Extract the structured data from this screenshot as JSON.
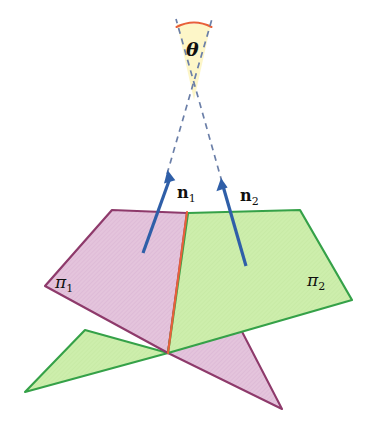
{
  "figure": {
    "background_color": "#ffffff",
    "width": 375,
    "height": 430
  },
  "labels": {
    "theta": "θ",
    "normal_1_symbol": "n",
    "normal_1_index": "1",
    "normal_2_symbol": "n",
    "normal_2_index": "2",
    "plane_1_symbol": "π",
    "plane_1_index": "1",
    "plane_2_symbol": "π",
    "plane_2_index": "2"
  },
  "colors": {
    "plane_1_fill": "#e4c4dc",
    "plane_1_stroke": "#8e3a6b",
    "plane_2_fill": "#cdeeac",
    "plane_2_stroke": "#35a148",
    "intersection_line": "#e8603a",
    "normal_arrow": "#2f5fa8",
    "dashed_line": "#6b7fa8",
    "angle_wedge_fill": "#fdf6c8",
    "angle_arc": "#e8603a",
    "text": "#10100f"
  },
  "geometry": {
    "plane_1": {
      "name": "pi-1",
      "description": "magenta plane, quadrilateral plus lower-right tail triangle",
      "main_polygon": [
        [
          112,
          210
        ],
        [
          45,
          286
        ],
        [
          168,
          353
        ],
        [
          187,
          213
        ]
      ],
      "tail_polygon": [
        [
          168,
          353
        ],
        [
          282,
          409
        ],
        [
          237,
          322
        ]
      ]
    },
    "plane_2": {
      "name": "pi-2",
      "description": "green plane, quadrilateral plus lower-left tail triangle",
      "main_polygon": [
        [
          188,
          213
        ],
        [
          300,
          210
        ],
        [
          352,
          300
        ],
        [
          168,
          353
        ]
      ],
      "tail_polygon": [
        [
          168,
          353
        ],
        [
          25,
          392
        ],
        [
          85,
          330
        ]
      ]
    },
    "intersection_line": {
      "from": [
        187,
        212
      ],
      "to": [
        168,
        353
      ]
    },
    "normal_1_arrow": {
      "from": [
        143,
        253
      ],
      "to": [
        168,
        172
      ]
    },
    "normal_2_arrow": {
      "from": [
        246,
        266
      ],
      "to": [
        221,
        180
      ]
    },
    "dashed_1": {
      "from": [
        168,
        172
      ],
      "to": [
        212,
        18
      ]
    },
    "dashed_2": {
      "from": [
        221,
        180
      ],
      "to": [
        176,
        18
      ]
    },
    "angle_wedge": {
      "apex": [
        194,
        100
      ],
      "left": [
        177,
        22
      ],
      "right": [
        211,
        22
      ]
    },
    "angle_arc": {
      "from": [
        177,
        26
      ],
      "to": [
        212,
        26
      ]
    }
  }
}
